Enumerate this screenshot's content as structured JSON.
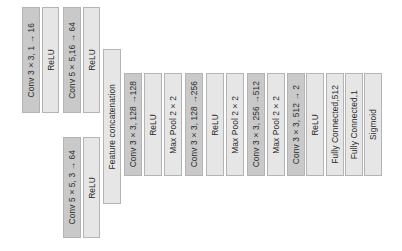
{
  "diagram": {
    "type": "network-architecture",
    "branch_top": [
      {
        "label": "Conv  3×3,  1 → 16",
        "kind": "conv"
      },
      {
        "label": "ReLU",
        "kind": "plain"
      },
      {
        "label": "Conv  5×5,16 → 64",
        "kind": "conv"
      },
      {
        "label": "ReLU",
        "kind": "plain"
      }
    ],
    "branch_bottom": [
      {
        "label": "Conv  5×5, 3 → 64",
        "kind": "conv"
      },
      {
        "label": "ReLU",
        "kind": "plain"
      }
    ],
    "concat": {
      "label": "Feature concatenation",
      "kind": "plain"
    },
    "main": [
      {
        "label": "Conv  3×3,  128 →128",
        "kind": "conv"
      },
      {
        "label": "ReLU",
        "kind": "plain"
      },
      {
        "label": "Max Pool 2×2",
        "kind": "plain"
      },
      {
        "label": "Conv  3×3,  128 →256",
        "kind": "conv"
      },
      {
        "label": "ReLU",
        "kind": "plain"
      },
      {
        "label": "Max Pool 2×2",
        "kind": "plain"
      },
      {
        "label": "Conv  3×3,  256 →512",
        "kind": "conv"
      },
      {
        "label": "Max Pool 2×2",
        "kind": "plain"
      },
      {
        "label": "Conv  3×3,  512 → 2",
        "kind": "conv"
      },
      {
        "label": "ReLU",
        "kind": "plain"
      },
      {
        "label": "Fully Connected,512",
        "kind": "plain"
      },
      {
        "label": "Fully Connected,1",
        "kind": "plain"
      },
      {
        "label": "Sigmoid",
        "kind": "plain"
      }
    ]
  },
  "colors": {
    "conv_fill": "#c9c9c9",
    "plain_fill": "#e6e6e6",
    "border": "#b4b4b4"
  }
}
